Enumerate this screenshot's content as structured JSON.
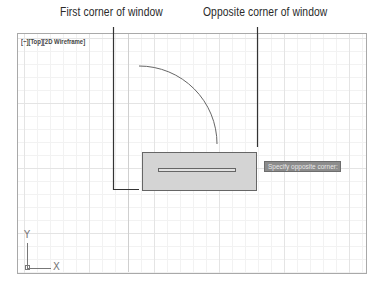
{
  "callouts": {
    "first_corner": "First corner of window",
    "opposite_corner": "Opposite corner of window"
  },
  "viewport": {
    "label": "[−][Top][2D Wireframe]"
  },
  "tooltip": {
    "text": "Specify opposite corner:"
  },
  "ucs_icon": {
    "x_label": "X",
    "y_label": "Y"
  },
  "colors": {
    "selection_fill": "#d4d4d4",
    "selection_border": "#666666",
    "tooltip_bg": "#8c8c8c",
    "grid_minor": "#f2f2f2",
    "grid_major": "#e4e4e4",
    "leader_line": "#333333"
  }
}
